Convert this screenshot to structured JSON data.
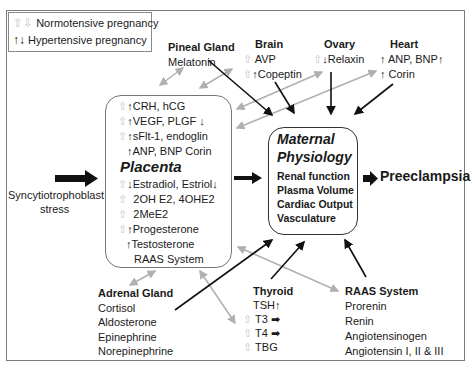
{
  "legend": {
    "normotensive": "Normotensive pregnancy",
    "hypertensive": "Hypertensive pregnancy"
  },
  "pineal": {
    "title": "Pineal Gland",
    "items": [
      "Melatonin"
    ]
  },
  "brain": {
    "title": "Brain",
    "items": [
      "AVP",
      "Copeptin"
    ]
  },
  "ovary": {
    "title": "Ovary",
    "items": [
      "Relaxin"
    ]
  },
  "heart": {
    "title": "Heart",
    "items": [
      "ANP, BNP",
      "Corin"
    ]
  },
  "placenta": {
    "title": "Placenta",
    "items_top": [
      "CRH, hCG",
      "VEGF, PLGF",
      "sFlt-1, endoglin",
      "ANP, BNP Corin"
    ],
    "items_bottom": [
      "Estradiol, Estriol",
      "2OH E2, 4OHE2",
      "2MeE2",
      "Progesterone",
      "Testosterone",
      "RAAS System"
    ]
  },
  "stress": {
    "line1": "Syncytiotrophoblast",
    "line2": "stress"
  },
  "maternal": {
    "title1": "Maternal",
    "title2": "Physiology",
    "items": [
      "Renal function",
      "Plasma Volume",
      "Cardiac Output",
      "Vasculature"
    ]
  },
  "outcome": "Preeclampsia",
  "adrenal": {
    "title": "Adrenal Gland",
    "items": [
      "Cortisol",
      "Aldosterone",
      "Epinephrine",
      "Norepinephrine"
    ]
  },
  "thyroid": {
    "title": "Thyroid",
    "items": [
      "TSH",
      "T3",
      "T4",
      "TBG"
    ]
  },
  "raas": {
    "title": "RAAS System",
    "items": [
      "Prorenin",
      "Renin",
      "Angiotensinogen",
      "Angiotensin I, II & III"
    ]
  },
  "colors": {
    "black_arrow": "#111111",
    "gray_arrow": "#b0b0b0",
    "hollow_arrow": "#c8c8c8",
    "frame": "#7a7a7a"
  }
}
